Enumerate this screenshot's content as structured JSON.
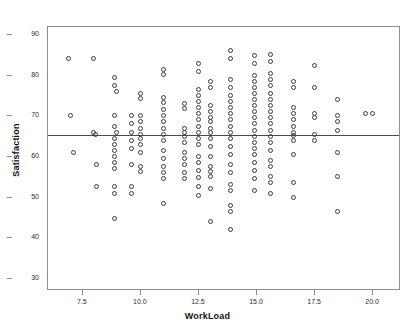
{
  "figure": {
    "cut_caption": "",
    "background": "#ffffff",
    "frame_color": "#8e8e8e",
    "marker_color": "#3c3c3c",
    "reference_line_color": "#4a4a4a"
  },
  "chart_data": {
    "type": "scatter",
    "title": "",
    "xlabel": "WorkLoad",
    "ylabel": "Satisfaction",
    "xlim": [
      6.0,
      21.2
    ],
    "ylim": [
      27.0,
      92.0
    ],
    "xticks": [
      7.5,
      10.0,
      12.5,
      15.0,
      17.5,
      20.0
    ],
    "xtick_labels": [
      "7.5",
      "10.0",
      "12.5",
      "15.0",
      "17.5",
      "20.0"
    ],
    "yticks": [
      30,
      40,
      50,
      60,
      70,
      80,
      90
    ],
    "ytick_labels": [
      "30",
      "40",
      "50",
      "60",
      "70",
      "80",
      "90"
    ],
    "grid": false,
    "legend": null,
    "reference_line": {
      "type": "horizontal",
      "y": 65.5,
      "label": "mean Satisfaction"
    },
    "marker": {
      "shape": "open-circle",
      "size": 5
    },
    "points": [
      [
        6.9,
        84.0
      ],
      [
        7.0,
        70.0
      ],
      [
        7.1,
        61.0
      ],
      [
        8.0,
        84.0
      ],
      [
        8.0,
        66.0
      ],
      [
        8.05,
        65.5
      ],
      [
        8.1,
        58.0
      ],
      [
        8.1,
        52.5
      ],
      [
        8.9,
        79.5
      ],
      [
        8.9,
        77.5
      ],
      [
        8.95,
        76.0
      ],
      [
        8.9,
        70.0
      ],
      [
        8.9,
        67.5
      ],
      [
        8.95,
        66.0
      ],
      [
        8.9,
        64.5
      ],
      [
        8.9,
        63.0
      ],
      [
        8.9,
        61.5
      ],
      [
        8.9,
        60.0
      ],
      [
        8.9,
        58.5
      ],
      [
        8.9,
        57.0
      ],
      [
        8.9,
        52.5
      ],
      [
        8.9,
        51.0
      ],
      [
        8.9,
        44.8
      ],
      [
        9.6,
        70.0
      ],
      [
        9.6,
        68.0
      ],
      [
        9.6,
        66.0
      ],
      [
        9.6,
        64.0
      ],
      [
        9.6,
        62.0
      ],
      [
        9.6,
        58.0
      ],
      [
        9.6,
        52.5
      ],
      [
        9.6,
        51.0
      ],
      [
        10.0,
        75.5
      ],
      [
        10.0,
        74.2
      ],
      [
        10.0,
        70.0
      ],
      [
        10.0,
        68.5
      ],
      [
        10.0,
        66.8
      ],
      [
        10.0,
        65.5
      ],
      [
        10.0,
        64.5
      ],
      [
        10.0,
        63.0
      ],
      [
        10.0,
        61.0
      ],
      [
        10.0,
        57.5
      ],
      [
        10.0,
        56.2
      ],
      [
        11.0,
        81.5
      ],
      [
        11.0,
        80.2
      ],
      [
        11.0,
        74.5
      ],
      [
        11.0,
        73.2
      ],
      [
        11.0,
        71.5
      ],
      [
        11.0,
        70.0
      ],
      [
        11.0,
        68.5
      ],
      [
        11.0,
        67.0
      ],
      [
        11.0,
        65.5
      ],
      [
        11.0,
        64.0
      ],
      [
        11.0,
        61.5
      ],
      [
        11.0,
        59.5
      ],
      [
        11.0,
        57.5
      ],
      [
        11.0,
        56.0
      ],
      [
        11.0,
        54.5
      ],
      [
        11.0,
        48.5
      ],
      [
        11.9,
        73.0
      ],
      [
        11.9,
        71.8
      ],
      [
        11.9,
        67.0
      ],
      [
        11.9,
        66.0
      ],
      [
        11.9,
        65.0
      ],
      [
        11.9,
        63.5
      ],
      [
        11.9,
        61.0
      ],
      [
        11.9,
        59.5
      ],
      [
        11.9,
        58.0
      ],
      [
        11.9,
        56.0
      ],
      [
        11.9,
        54.5
      ],
      [
        12.5,
        83.0
      ],
      [
        12.5,
        81.0
      ],
      [
        12.5,
        76.5
      ],
      [
        12.5,
        75.0
      ],
      [
        12.5,
        73.5
      ],
      [
        12.5,
        72.0
      ],
      [
        12.5,
        70.5
      ],
      [
        12.5,
        69.0
      ],
      [
        12.5,
        67.5
      ],
      [
        12.5,
        66.0
      ],
      [
        12.5,
        64.5
      ],
      [
        12.5,
        63.0
      ],
      [
        12.5,
        60.0
      ],
      [
        12.5,
        58.5
      ],
      [
        12.5,
        56.5
      ],
      [
        12.5,
        54.8
      ],
      [
        12.5,
        52.5
      ],
      [
        12.5,
        50.5
      ],
      [
        13.0,
        78.5
      ],
      [
        13.0,
        77.0
      ],
      [
        13.0,
        72.5
      ],
      [
        13.0,
        71.0
      ],
      [
        13.0,
        69.5
      ],
      [
        13.0,
        68.5
      ],
      [
        13.0,
        67.0
      ],
      [
        13.0,
        65.8
      ],
      [
        13.0,
        64.5
      ],
      [
        13.0,
        62.5
      ],
      [
        13.0,
        60.0
      ],
      [
        13.0,
        57.5
      ],
      [
        13.0,
        56.2
      ],
      [
        13.0,
        55.0
      ],
      [
        13.0,
        52.0
      ],
      [
        13.0,
        44.0
      ],
      [
        13.9,
        86.0
      ],
      [
        13.9,
        84.2
      ],
      [
        13.9,
        79.0
      ],
      [
        13.9,
        77.0
      ],
      [
        13.9,
        75.0
      ],
      [
        13.9,
        73.5
      ],
      [
        13.9,
        72.0
      ],
      [
        13.9,
        70.5
      ],
      [
        13.9,
        69.0
      ],
      [
        13.9,
        67.5
      ],
      [
        13.9,
        66.0
      ],
      [
        13.9,
        64.5
      ],
      [
        13.9,
        62.5
      ],
      [
        13.9,
        60.5
      ],
      [
        13.9,
        58.0
      ],
      [
        13.9,
        56.0
      ],
      [
        13.9,
        53.0
      ],
      [
        13.9,
        51.5
      ],
      [
        13.9,
        48.0
      ],
      [
        13.9,
        46.5
      ],
      [
        13.9,
        42.0
      ],
      [
        14.9,
        84.8
      ],
      [
        14.9,
        83.0
      ],
      [
        14.9,
        80.0
      ],
      [
        14.9,
        78.5
      ],
      [
        14.9,
        77.0
      ],
      [
        14.9,
        75.5
      ],
      [
        14.9,
        74.0
      ],
      [
        14.9,
        72.5
      ],
      [
        14.9,
        71.0
      ],
      [
        14.9,
        69.5
      ],
      [
        14.9,
        68.0
      ],
      [
        14.9,
        66.5
      ],
      [
        14.9,
        65.0
      ],
      [
        14.9,
        63.5
      ],
      [
        14.9,
        62.0
      ],
      [
        14.9,
        60.5
      ],
      [
        14.9,
        58.5
      ],
      [
        14.9,
        56.5
      ],
      [
        14.9,
        54.5
      ],
      [
        14.9,
        51.5
      ],
      [
        15.6,
        85.0
      ],
      [
        15.6,
        83.5
      ],
      [
        15.6,
        80.5
      ],
      [
        15.6,
        79.0
      ],
      [
        15.6,
        77.5
      ],
      [
        15.6,
        75.5
      ],
      [
        15.6,
        74.0
      ],
      [
        15.6,
        72.5
      ],
      [
        15.6,
        71.0
      ],
      [
        15.6,
        69.5
      ],
      [
        15.6,
        68.0
      ],
      [
        15.6,
        66.5
      ],
      [
        15.6,
        65.0
      ],
      [
        15.6,
        63.5
      ],
      [
        15.6,
        61.5
      ],
      [
        15.6,
        59.0
      ],
      [
        15.6,
        57.5
      ],
      [
        15.6,
        55.0
      ],
      [
        15.6,
        53.5
      ],
      [
        15.6,
        51.0
      ],
      [
        16.6,
        78.5
      ],
      [
        16.6,
        77.0
      ],
      [
        16.6,
        72.0
      ],
      [
        16.6,
        70.5
      ],
      [
        16.6,
        69.0
      ],
      [
        16.6,
        67.5
      ],
      [
        16.6,
        66.0
      ],
      [
        16.6,
        65.2
      ],
      [
        16.6,
        64.0
      ],
      [
        16.6,
        60.5
      ],
      [
        16.6,
        53.5
      ],
      [
        16.6,
        50.0
      ],
      [
        17.5,
        82.5
      ],
      [
        17.5,
        77.0
      ],
      [
        17.5,
        70.5
      ],
      [
        17.5,
        69.5
      ],
      [
        17.5,
        65.5
      ],
      [
        17.5,
        64.0
      ],
      [
        18.5,
        74.0
      ],
      [
        18.5,
        70.0
      ],
      [
        18.5,
        68.5
      ],
      [
        18.5,
        66.5
      ],
      [
        18.5,
        61.0
      ],
      [
        18.5,
        55.0
      ],
      [
        18.5,
        46.5
      ],
      [
        19.7,
        70.5
      ],
      [
        20.0,
        70.5
      ]
    ],
    "n_points": 186
  },
  "axes": {
    "y_title": "Satisfaction",
    "x_title": "WorkLoad"
  }
}
